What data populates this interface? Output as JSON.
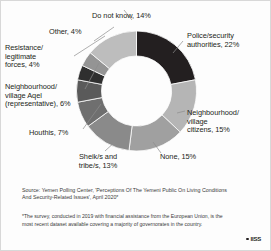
{
  "chart_data": {
    "type": "pie",
    "variant": "donut",
    "title": "",
    "categories": [
      "Police/security authorities",
      "Neighbourhood/village citizens",
      "None",
      "Sheik/s and tribe/s",
      "Houthis",
      "Neighbourhood/village Aqel (representative)",
      "Resistance/legitimate forces",
      "Other",
      "Do not know"
    ],
    "values": [
      22,
      15,
      15,
      13,
      7,
      6,
      4,
      4,
      14
    ],
    "unit": "%",
    "legend": "none",
    "data_labels": true,
    "slice_colors": [
      "#231f20",
      "#b5b5b5",
      "#a0a0a0",
      "#8a8a8a",
      "#6f6f6f",
      "#5a5a5a",
      "#2f2f2f",
      "#949494",
      "#bdbdbd"
    ],
    "labels": [
      "Police/security\nauthorities, 22%",
      "Neighbourhood/\nvillage\ncitizens, 15%",
      "None, 15%",
      "Sheik/s and\ntribe/s, 13%",
      "Houthis, 7%",
      "Neighbourhood/\nvillage Aqel\n(representative), 6%",
      "Resistance/\nlegitimate\nforces, 4%",
      "Other, 4%",
      "Do not know, 14%"
    ]
  },
  "footer": {
    "source": "Source: Yemen Polling Center, 'Perceptions Of The Yemeni Public On Living Conditions\nAnd Security-Related Issues', April 2020*",
    "note": "*The survey, conducted in 2019 with financial assistance from the European Union, is the\nmost recent dataset available covering a majority of governorates in the country."
  },
  "branding": {
    "wordmark": "IISS"
  }
}
